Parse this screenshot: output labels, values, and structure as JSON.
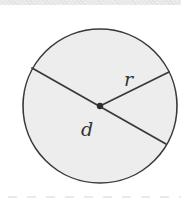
{
  "diagram": {
    "shape": "circle",
    "center": {
      "x": 100,
      "y": 106
    },
    "radius_px": 77,
    "colors": {
      "fill": "#ededed",
      "stroke": "#3a3a3a",
      "center_dot": "#2e2e2e",
      "dashes": "#d6d6d6"
    },
    "segments": [
      {
        "name": "diameter",
        "x1": 32,
        "y1": 68,
        "x2": 166,
        "y2": 144
      },
      {
        "name": "radius",
        "x1": 100,
        "y1": 106,
        "x2": 169,
        "y2": 72
      }
    ],
    "labels": {
      "radius": "r",
      "diameter": "d"
    }
  }
}
